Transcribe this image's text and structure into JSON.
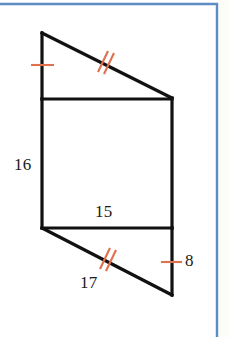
{
  "figure": {
    "kind": "geometry-diagram",
    "colors": {
      "stroke": "#111111",
      "tick": "#e0714f",
      "page_rule": "#5b8cc4",
      "background": "#ffffff",
      "margin_strip": "#fdfdf7"
    },
    "stroke_width": 3.2,
    "tick_width": 2.0,
    "vertices": {
      "top_apex": [
        42,
        33
      ],
      "upper_left": [
        42,
        99
      ],
      "upper_right": [
        172,
        98
      ],
      "lower_left": [
        42,
        228
      ],
      "lower_right": [
        172,
        228
      ],
      "bottom_apex": [
        172,
        295
      ]
    },
    "segments": [
      {
        "name": "top-diagonal",
        "from": "top_apex",
        "to": "upper_right"
      },
      {
        "name": "left-upper-vertical",
        "from": "top_apex",
        "to": "upper_left"
      },
      {
        "name": "upper-horizontal",
        "from": "upper_left",
        "to": "upper_right"
      },
      {
        "name": "left-vertical",
        "from": "upper_left",
        "to": "lower_left"
      },
      {
        "name": "right-vertical",
        "from": "upper_right",
        "to": "lower_right"
      },
      {
        "name": "lower-horizontal",
        "from": "lower_left",
        "to": "lower_right"
      },
      {
        "name": "bottom-diagonal",
        "from": "lower_left",
        "to": "bottom_apex"
      },
      {
        "name": "right-lower-vertical",
        "from": "lower_right",
        "to": "bottom_apex"
      }
    ],
    "tick_marks": [
      {
        "name": "single-tick-left-upper",
        "count": 1,
        "on": "left-upper-vertical",
        "center": [
          42,
          65
        ]
      },
      {
        "name": "double-tick-top-diagonal",
        "count": 2,
        "on": "top-diagonal",
        "center": [
          104,
          62
        ]
      },
      {
        "name": "double-tick-bottom-diagonal",
        "count": 2,
        "on": "bottom-diagonal",
        "center": [
          106,
          259
        ]
      },
      {
        "name": "single-tick-right-lower",
        "count": 1,
        "on": "right-lower-vertical",
        "center": [
          172,
          262
        ]
      }
    ]
  },
  "labels": {
    "left_side": "16",
    "middle_base": "15",
    "bottom_diagonal": "17",
    "right_lower": "8"
  },
  "page_rule": {
    "top_y": 4,
    "right_x": 217,
    "color": "#5b8cc4"
  }
}
